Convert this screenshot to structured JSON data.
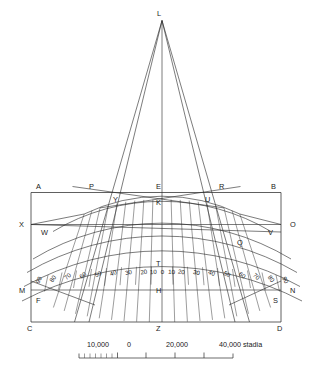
{
  "figure": {
    "apex_label": "L",
    "background_color": "#ffffff",
    "ink_color": "#2b2b2b"
  },
  "point_labels": {
    "apex": "L",
    "frame_top_left": "A",
    "frame_top_right": "B",
    "frame_bottom_left": "C",
    "frame_bottom_right": "D",
    "top_center": "E",
    "top_left_inner": "P",
    "top_right_inner": "R",
    "arc_top_left": "Y",
    "arc_top_center": "K",
    "arc_top_right": "U",
    "mid_left_edge": "X",
    "mid_right_edge": "O",
    "mid_left_inner": "W",
    "mid_right_inner": "V",
    "mid_center": "T",
    "mid_right_lower": "Q",
    "low_left_edge": "M",
    "low_right_edge": "N",
    "low_left_inner": "F",
    "low_right_inner": "S",
    "low_center": "H",
    "bottom_center": "Z"
  },
  "degree_scale": {
    "west": [
      "90",
      "80",
      "70",
      "60",
      "50",
      "40",
      "30",
      "20",
      "10"
    ],
    "center": "0",
    "east": [
      "10",
      "20",
      "30",
      "40",
      "50",
      "60",
      "70",
      "80",
      "90"
    ]
  },
  "scale_bar": {
    "labels": [
      "10,000",
      "0",
      "20,000",
      "40,000"
    ],
    "unit": "stadia",
    "unit_label": "40,000 stadia"
  }
}
